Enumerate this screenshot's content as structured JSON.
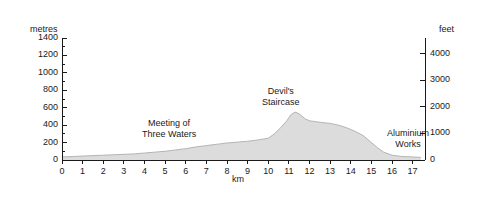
{
  "chart_data": {
    "type": "area",
    "title": "",
    "xlabel": "km",
    "ylabel": "metres",
    "ylabel_right": "feet",
    "xlim": [
      0,
      17.6
    ],
    "ylim": [
      0,
      1400
    ],
    "ylim_right": [
      0,
      4593
    ],
    "grid": false,
    "legend": "none",
    "x_ticks": [
      0,
      1,
      2,
      3,
      4,
      5,
      6,
      7,
      8,
      9,
      10,
      11,
      12,
      13,
      14,
      15,
      16,
      17
    ],
    "x_tick_labels": [
      "0",
      "1",
      "2",
      "3",
      "4",
      "5",
      "6",
      "7",
      "8",
      "9",
      "10",
      "11",
      "12",
      "13",
      "14",
      "15",
      "16",
      "17"
    ],
    "y_ticks_left": [
      0,
      200,
      400,
      600,
      800,
      1000,
      1200,
      1400
    ],
    "y_tick_labels_left": [
      "0",
      "200",
      "400",
      "600",
      "800",
      "1000",
      "1200",
      "1400"
    ],
    "y_minor_step_left": 100,
    "y_ticks_right": [
      0,
      1000,
      2000,
      3000,
      4000
    ],
    "y_tick_labels_right": [
      "0",
      "1000",
      "2000",
      "3000",
      "4000"
    ],
    "fill_color": "#dcdcdc",
    "line_color": "#b4b4b4",
    "axis_color": "#1a1a1a",
    "series": [
      {
        "name": "elevation profile",
        "x": [
          0,
          0.5,
          1,
          1.5,
          2,
          2.5,
          3,
          3.5,
          4,
          4.5,
          5,
          5.5,
          6,
          6.5,
          7,
          7.5,
          8,
          8.5,
          9,
          9.5,
          10,
          10.3,
          10.6,
          10.9,
          11.1,
          11.3,
          11.5,
          11.8,
          12,
          12.3,
          12.6,
          13,
          13.4,
          13.8,
          14.2,
          14.6,
          15,
          15.3,
          15.6,
          16,
          16.5,
          17,
          17.4
        ],
        "y": [
          35,
          40,
          45,
          50,
          55,
          60,
          65,
          70,
          80,
          90,
          100,
          115,
          130,
          150,
          165,
          180,
          195,
          205,
          215,
          230,
          250,
          300,
          370,
          450,
          520,
          550,
          530,
          470,
          450,
          440,
          430,
          420,
          400,
          370,
          330,
          280,
          200,
          140,
          90,
          55,
          40,
          35,
          30
        ]
      }
    ],
    "annotations": [
      {
        "text_line1": "Meeting of",
        "text_line2": "Three Waters",
        "x_km": 6.2,
        "y_m": 330
      },
      {
        "text_line1": "Devil's",
        "text_line2": "Staircase",
        "x_km": 11.2,
        "y_m": 700
      },
      {
        "text_line1": "Aluminium",
        "text_line2": "Works",
        "x_km": 16.3,
        "y_m": 215
      }
    ]
  }
}
